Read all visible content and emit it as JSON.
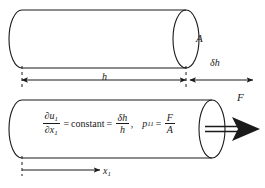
{
  "figure": {
    "name": "uniaxial-extension-cylinder-diagram",
    "background_color": "#ffffff",
    "line_color": "#1a1a1a",
    "text_color": "#1a1a1a"
  },
  "labels": {
    "area": "A",
    "delta_h": "δh",
    "height": "h",
    "force": "F",
    "axis_x1": "x",
    "axis_x1_sub": "1"
  },
  "equation": {
    "strain_numerator": "∂u",
    "strain_numerator_sub": "1",
    "strain_denominator": "∂x",
    "strain_denominator_sub": "1",
    "equals_1": "=",
    "constant_word": "constant",
    "equals_2": "=",
    "delta_h_over_h_num": "δh",
    "delta_h_over_h_den": "h",
    "comma": ",",
    "stress_symbol": "p",
    "stress_sub": "11",
    "equals_3": "=",
    "force_over_area_num": "F",
    "force_over_area_den": "A"
  },
  "dimensions": {
    "h_label": "h",
    "delta_h_label": "δh",
    "axis_label": "x1"
  }
}
